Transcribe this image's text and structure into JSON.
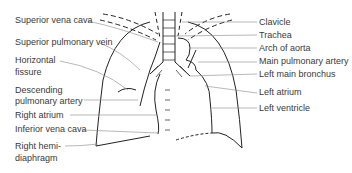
{
  "diagram": {
    "left_labels": [
      {
        "id": "svc",
        "text": "Superior vena cava"
      },
      {
        "id": "spv",
        "text": "Superior pulmonary vein"
      },
      {
        "id": "hf1",
        "text": "Horizontal"
      },
      {
        "id": "hf2",
        "text": "fissure"
      },
      {
        "id": "dpa1",
        "text": "Descending"
      },
      {
        "id": "dpa2",
        "text": "pulmonary artery"
      },
      {
        "id": "ra",
        "text": "Right atrium"
      },
      {
        "id": "ivc",
        "text": "Inferior vena cava"
      },
      {
        "id": "rhd1",
        "text": "Right hemi-"
      },
      {
        "id": "rhd2",
        "text": "diaphragm"
      }
    ],
    "right_labels": [
      {
        "id": "clav",
        "text": "Clavicle"
      },
      {
        "id": "trach",
        "text": "Trachea"
      },
      {
        "id": "aorta",
        "text": "Arch of aorta"
      },
      {
        "id": "mpa",
        "text": "Main pulmonary artery"
      },
      {
        "id": "lmb",
        "text": "Left main bronchus"
      },
      {
        "id": "la",
        "text": "Left atrium"
      },
      {
        "id": "lv",
        "text": "Left ventricle"
      }
    ],
    "colors": {
      "line": "#222222",
      "leader": "#777777",
      "text": "#3a3a3a"
    }
  }
}
